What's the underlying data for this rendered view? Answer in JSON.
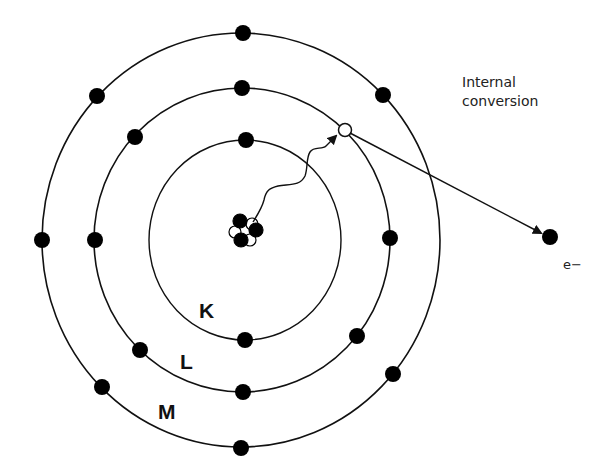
{
  "diagram": {
    "title": "Internal conversion",
    "annotation": {
      "line1": "Internal",
      "line2": "conversion"
    },
    "shells": [
      {
        "name": "K",
        "label": "K",
        "cx": 245,
        "cy": 240,
        "rx": 96,
        "ry": 100,
        "electrons": [
          [
            246,
            140
          ],
          [
            245,
            340
          ]
        ]
      },
      {
        "name": "L",
        "label": "L",
        "cx": 242,
        "cy": 240,
        "rx": 148,
        "ry": 152,
        "electrons": [
          [
            242,
            88
          ],
          [
            135,
            137
          ],
          [
            95,
            240
          ],
          [
            140,
            350
          ],
          [
            243,
            392
          ],
          [
            357,
            336
          ],
          [
            390,
            238
          ]
        ]
      },
      {
        "name": "M",
        "label": "M",
        "cx": 241,
        "cy": 240,
        "rx": 199,
        "ry": 207,
        "electrons": [
          [
            243,
            33
          ],
          [
            97,
            96
          ],
          [
            383,
            95
          ],
          [
            42,
            240
          ],
          [
            102,
            387
          ],
          [
            241,
            448
          ],
          [
            393,
            374
          ]
        ]
      }
    ],
    "vacancy": {
      "x": 345,
      "y": 130,
      "r": 6
    },
    "ejected_electron": {
      "x": 550,
      "y": 237,
      "label": "e−"
    },
    "nucleus": {
      "cx": 242,
      "cy": 231
    },
    "colors": {
      "line": "#111111",
      "fill": "#000000",
      "background": "#ffffff"
    }
  }
}
